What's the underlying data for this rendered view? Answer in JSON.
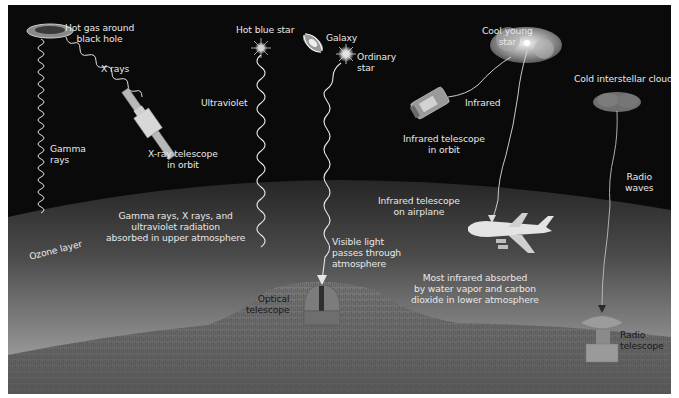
{
  "diagram": {
    "title": "",
    "colors": {
      "sky": "#0a0a0a",
      "atmosphere_top": "#2a2a2a",
      "atmosphere_bottom": "#a8a8a8",
      "ground": "#6e6e6e",
      "wave": "#e6e6e6",
      "label": "#e8e8e8",
      "label_dark": "#1a1a1a"
    },
    "sources": [
      {
        "id": "black-hole",
        "label": "Hot gas around\nblack hole"
      },
      {
        "id": "hot-blue-star",
        "label": "Hot blue star"
      },
      {
        "id": "galaxy",
        "label": "Galaxy"
      },
      {
        "id": "ordinary-star",
        "label": "Ordinary\nstar"
      },
      {
        "id": "cool-young-star",
        "label": "Cool young\nstar"
      },
      {
        "id": "cold-cloud",
        "label": "Cold interstellar cloud"
      }
    ],
    "radiation": [
      {
        "id": "x-rays",
        "label": "X rays"
      },
      {
        "id": "gamma-rays",
        "label": "Gamma\nrays"
      },
      {
        "id": "ultraviolet",
        "label": "Ultraviolet"
      },
      {
        "id": "infrared",
        "label": "Infrared"
      },
      {
        "id": "radio-waves",
        "label": "Radio\nwaves"
      }
    ],
    "instruments": [
      {
        "id": "xray-telescope",
        "label": "X-ray telescope\nin orbit"
      },
      {
        "id": "ir-telescope-orbit",
        "label": "Infrared telescope\nin orbit"
      },
      {
        "id": "ir-telescope-airplane",
        "label": "Infrared telescope\non airplane"
      },
      {
        "id": "optical-telescope",
        "label": "Optical\ntelescope"
      },
      {
        "id": "radio-telescope",
        "label": "Radio\ntelescope"
      }
    ],
    "annotations": [
      {
        "id": "upper-absorption",
        "label": "Gamma rays, X rays, and\nultraviolet radiation\nabsorbed in upper atmosphere"
      },
      {
        "id": "ozone",
        "label": "Ozone layer"
      },
      {
        "id": "visible-passes",
        "label": "Visible light\npasses through\natmosphere"
      },
      {
        "id": "ir-absorbed",
        "label": "Most infrared absorbed\nby water vapor and carbon\ndioxide in lower atmosphere"
      }
    ]
  }
}
